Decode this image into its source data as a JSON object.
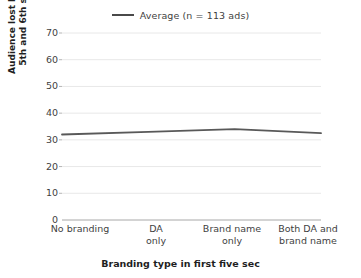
{
  "chart_data": {
    "type": "line",
    "title": "",
    "categories": [
      "No branding",
      "DA\nonly",
      "Brand name\nonly",
      "Both DA and\nbrand name"
    ],
    "category_lines": [
      [
        "No branding",
        ""
      ],
      [
        "DA",
        "only"
      ],
      [
        "Brand name",
        "only"
      ],
      [
        "Both DA and",
        "brand name"
      ]
    ],
    "series": [
      {
        "name": "Average (n = 113 ads)",
        "values": [
          32,
          33,
          34,
          32.5
        ],
        "color": "#595959"
      }
    ],
    "xlabel": "Branding type in first five sec",
    "ylabel": "Audience lost between 5th and 6th sec (%)",
    "ylabel_lines": [
      "Audience lost between",
      "5th and 6th sec (%)"
    ],
    "ylim": [
      0,
      70
    ],
    "ytick_step": 10,
    "yticks": [
      "70",
      "60",
      "50",
      "40",
      "30",
      "20",
      "10",
      "0"
    ],
    "ytick_values": [
      70,
      60,
      50,
      40,
      30,
      20,
      10,
      0
    ],
    "grid": true,
    "grid_color": "#e8e8e8",
    "axis_color": "#b0b0b0",
    "legend": {
      "position": "top-center",
      "entries": [
        {
          "label": "Average (n = 113 ads)",
          "color": "#4a4a4a"
        }
      ]
    }
  }
}
